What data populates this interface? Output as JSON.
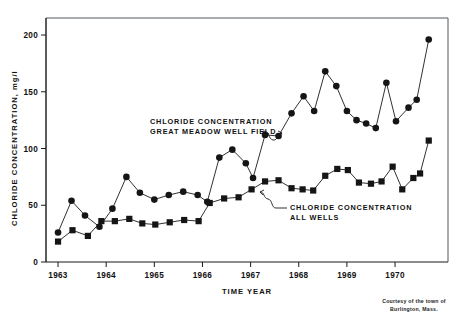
{
  "figure": {
    "credit_line_1": "Courtesy of the town of",
    "credit_line_2": "Burlington, Mass."
  },
  "annotations": {
    "great_meadow": {
      "line1": "CHLORIDE CONCENTRATION",
      "line2": "GREAT MEADOW WELL FIELD"
    },
    "all_wells": {
      "line1": "CHLORIDE CONCENTRATION",
      "line2": "ALL WELLS"
    }
  },
  "axes": {
    "y_title": "CHLORIDE CONCENTRATION, mg/l",
    "x_title": "TIME  YEAR",
    "y_ticks": [
      "0",
      "50",
      "100",
      "150",
      "200"
    ],
    "x_ticks": [
      "1963",
      "1964",
      "1965",
      "1966",
      "1967",
      "1968",
      "1969",
      "1970"
    ]
  },
  "chart_data": {
    "type": "line",
    "title": "",
    "xlabel": "TIME  YEAR",
    "ylabel": "CHLORIDE CONCENTRATION, mg/l",
    "xlim": [
      1962.75,
      1971.1
    ],
    "ylim": [
      0,
      215
    ],
    "y_ticks": [
      0,
      50,
      100,
      150,
      200
    ],
    "x_ticks": [
      1963,
      1964,
      1965,
      1966,
      1967,
      1968,
      1969,
      1970
    ],
    "grid": false,
    "legend": "annotations-inline",
    "annotation_1": "CHLORIDE CONCENTRATION GREAT MEADOW WELL FIELD",
    "annotation_2": "CHLORIDE CONCENTRATION ALL WELLS",
    "credit": "Courtesy of the town of Burlington, Mass.",
    "series": [
      {
        "name": "CHLORIDE CONCENTRATION GREAT MEADOW WELL FIELD",
        "marker": "circle",
        "color": "#151515",
        "points": [
          [
            1963.0,
            26
          ],
          [
            1963.28,
            54
          ],
          [
            1963.56,
            41
          ],
          [
            1963.86,
            31
          ],
          [
            1964.13,
            47
          ],
          [
            1964.42,
            75
          ],
          [
            1964.7,
            61
          ],
          [
            1965.0,
            55
          ],
          [
            1965.3,
            59
          ],
          [
            1965.6,
            62
          ],
          [
            1965.9,
            59
          ],
          [
            1966.1,
            53
          ],
          [
            1966.35,
            92
          ],
          [
            1966.62,
            99
          ],
          [
            1966.9,
            87
          ],
          [
            1967.05,
            74
          ],
          [
            1967.3,
            112
          ],
          [
            1967.58,
            111
          ],
          [
            1967.85,
            131
          ],
          [
            1968.1,
            146
          ],
          [
            1968.32,
            133
          ],
          [
            1968.55,
            168
          ],
          [
            1968.78,
            155
          ],
          [
            1969.0,
            133
          ],
          [
            1969.2,
            125
          ],
          [
            1969.4,
            122
          ],
          [
            1969.6,
            118
          ],
          [
            1969.82,
            158
          ],
          [
            1970.02,
            124
          ],
          [
            1970.28,
            136
          ],
          [
            1970.45,
            143
          ],
          [
            1970.7,
            196
          ]
        ]
      },
      {
        "name": "CHLORIDE CONCENTRATION ALL WELLS",
        "marker": "square",
        "color": "#151515",
        "points": [
          [
            1963.0,
            18
          ],
          [
            1963.3,
            28
          ],
          [
            1963.62,
            23
          ],
          [
            1963.9,
            36
          ],
          [
            1964.18,
            36
          ],
          [
            1964.48,
            38
          ],
          [
            1964.75,
            34
          ],
          [
            1965.02,
            33
          ],
          [
            1965.32,
            35
          ],
          [
            1965.62,
            37
          ],
          [
            1965.92,
            36
          ],
          [
            1966.15,
            52
          ],
          [
            1966.45,
            56
          ],
          [
            1966.75,
            57
          ],
          [
            1967.02,
            64
          ],
          [
            1967.3,
            71
          ],
          [
            1967.58,
            72
          ],
          [
            1967.85,
            65
          ],
          [
            1968.08,
            64
          ],
          [
            1968.3,
            63
          ],
          [
            1968.55,
            76
          ],
          [
            1968.8,
            82
          ],
          [
            1969.02,
            81
          ],
          [
            1969.25,
            70
          ],
          [
            1969.5,
            69
          ],
          [
            1969.72,
            71
          ],
          [
            1969.95,
            84
          ],
          [
            1970.15,
            64
          ],
          [
            1970.38,
            74
          ],
          [
            1970.52,
            78
          ],
          [
            1970.7,
            107
          ]
        ]
      }
    ]
  }
}
